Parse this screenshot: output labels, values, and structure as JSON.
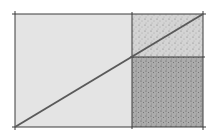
{
  "diagram": {
    "colors": {
      "background": "#ffffff",
      "left_region": "#e4e4e4",
      "top_right_region": "#d2d2d2",
      "bottom_right_region": "#a9a9a9",
      "outline": "#3a3a3a",
      "diagonal": "#5a5a5a"
    },
    "regions": [
      {
        "name": "left-rectangle",
        "x": 15,
        "y": 14,
        "w": 117,
        "h": 113
      },
      {
        "name": "top-right-rectangle",
        "x": 132,
        "y": 14,
        "w": 71,
        "h": 43
      },
      {
        "name": "bottom-right-square",
        "x": 132,
        "y": 57,
        "w": 71,
        "h": 70
      }
    ],
    "diagonal": {
      "x1": 15,
      "y1": 127,
      "x2": 203,
      "y2": 14
    }
  }
}
